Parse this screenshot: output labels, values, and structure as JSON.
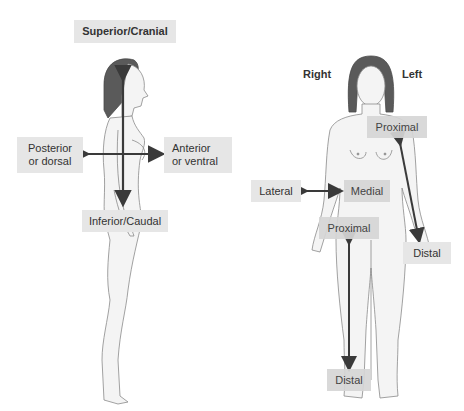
{
  "diagram": {
    "lateral_view": {
      "labels": {
        "superior": "Superior/Cranial",
        "posterior_line1": "Posterior",
        "posterior_line2": "or dorsal",
        "anterior_line1": "Anterior",
        "anterior_line2": "or ventral",
        "inferior": "Inferior/Caudal"
      }
    },
    "anterior_view": {
      "sides": {
        "right": "Right",
        "left": "Left"
      },
      "labels": {
        "proximal_arm": "Proximal",
        "distal_arm": "Distal",
        "lateral": "Lateral",
        "medial": "Medial",
        "proximal_leg": "Proximal",
        "distal_leg": "Distal"
      }
    },
    "colors": {
      "label_bg": "#e6e6e6",
      "arrow": "#3a3a3a",
      "hair": "#5a5a5a",
      "skin_outline": "#8a8a8a",
      "skin_fill": "#f4f4f4"
    }
  }
}
